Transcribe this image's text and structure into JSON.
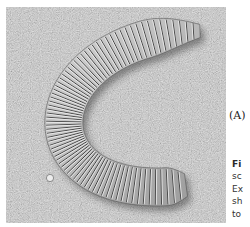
{
  "figure": {
    "panel_label": "(A)",
    "image_description": "Scanning electron micrograph of a C-shaped ribbed diatom frustule on a granular substrate",
    "caption_fragments": [
      "Fi",
      "sc",
      "Ex",
      "sh",
      "to"
    ]
  },
  "colors": {
    "background": "#ffffff",
    "substrate": "#b9b9b9",
    "diatom_light": "#e8e8e8",
    "diatom_dark": "#3a3a3a",
    "text": "#333333"
  }
}
